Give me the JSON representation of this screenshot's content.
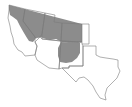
{
  "map": {
    "title": "Species distribution range map — southwestern United States",
    "region": "Southwestern United States",
    "states": [
      "California",
      "Nevada",
      "Utah",
      "Colorado",
      "Arizona",
      "New Mexico",
      "Texas",
      "Oklahoma panhandle"
    ],
    "range_label": "Shaded range",
    "colors": {
      "background": "#ffffff",
      "outline": "#7a7a7a",
      "range_fill": "#8c8c8c"
    }
  }
}
